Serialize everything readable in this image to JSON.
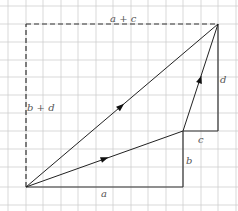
{
  "diagram": {
    "grid": {
      "color": "#cfcfcf",
      "x_lines": [
        8,
        26,
        43,
        61,
        78,
        96,
        113,
        131,
        148,
        166,
        183,
        201,
        218,
        236
      ],
      "y_lines": [
        6,
        24,
        42,
        60,
        77,
        95,
        113,
        131,
        149,
        167,
        187,
        205
      ]
    },
    "points": {
      "origin": [
        26,
        187
      ],
      "mid": [
        183,
        131
      ],
      "end": [
        218,
        24
      ],
      "corner_a": [
        183,
        187
      ],
      "corner_c": [
        218,
        131
      ],
      "top_left": [
        26,
        24
      ]
    },
    "labels": {
      "a": "a",
      "b": "b",
      "c": "c",
      "d": "d",
      "a_plus_c": "a + c",
      "b_plus_d": "b + d"
    },
    "colors": {
      "line": "#222222",
      "component": "#333333",
      "dashed": "#333333",
      "label": "#555555"
    }
  }
}
